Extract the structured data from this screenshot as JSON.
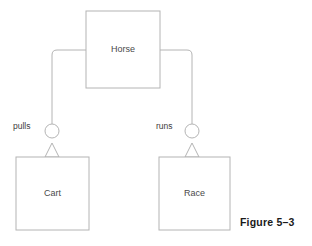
{
  "figure": {
    "caption": "Figure 5–3",
    "caption_x": 240,
    "caption_y": 216
  },
  "style": {
    "stroke_color": "#b4b4b4",
    "box_fill": "#ffffff",
    "label_color": "#4a4a4a",
    "edge_label_color": "#3c3c3c",
    "caption_color": "#1a1a1a",
    "stroke_width": 1
  },
  "diagram": {
    "type": "uml-class-diagram",
    "nodes": [
      {
        "id": "horse",
        "label": "Horse",
        "x": 86,
        "y": 11,
        "width": 74,
        "height": 77
      },
      {
        "id": "cart",
        "label": "Cart",
        "x": 16,
        "y": 157,
        "width": 73,
        "height": 73
      },
      {
        "id": "race",
        "label": "Race",
        "x": 159,
        "y": 157,
        "width": 71,
        "height": 73
      }
    ],
    "edges": [
      {
        "id": "pulls",
        "label": "pulls",
        "from": "horse",
        "to": "cart",
        "label_x": 13,
        "label_y": 127,
        "path": "M 86 50 L 57 50 Q 52 50 52 55 L 52 124",
        "circle_cx": 52,
        "circle_cy": 131,
        "circle_r": 7,
        "arrow_apex_x": 52,
        "arrow_apex_y": 143,
        "arrow_base_y": 157,
        "arrow_half_width": 7
      },
      {
        "id": "runs",
        "label": "runs",
        "from": "horse",
        "to": "race",
        "label_x": 156,
        "label_y": 127,
        "path": "M 160 50 L 187 50 Q 192 50 192 55 L 192 124",
        "circle_cx": 192,
        "circle_cy": 131,
        "circle_r": 7,
        "arrow_apex_x": 192,
        "arrow_apex_y": 143,
        "arrow_base_y": 157,
        "arrow_half_width": 7
      }
    ]
  }
}
